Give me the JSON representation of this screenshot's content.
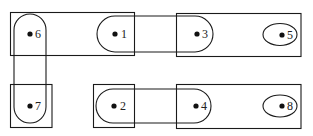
{
  "diagram": {
    "type": "hypergraph",
    "background": "#ffffff",
    "stroke_color": "#1a1a1a",
    "vertices": [
      {
        "id": "1",
        "label": "1",
        "x": 115,
        "y": 34
      },
      {
        "id": "2",
        "label": "2",
        "x": 113,
        "y": 106
      },
      {
        "id": "3",
        "label": "3",
        "x": 196,
        "y": 34
      },
      {
        "id": "4",
        "label": "4",
        "x": 195,
        "y": 106
      },
      {
        "id": "5",
        "label": "5",
        "x": 282,
        "y": 34
      },
      {
        "id": "6",
        "label": "6",
        "x": 30,
        "y": 34
      },
      {
        "id": "7",
        "label": "7",
        "x": 30,
        "y": 106
      },
      {
        "id": "8",
        "label": "8",
        "x": 282,
        "y": 106
      }
    ],
    "hyperedges": [
      {
        "name": "rect-top-left",
        "shape": "rectangle",
        "members": [
          "6",
          "1"
        ]
      },
      {
        "name": "rect-top-right",
        "shape": "rectangle",
        "members": [
          "3",
          "5"
        ]
      },
      {
        "name": "rect-bottom-7",
        "shape": "rectangle",
        "members": [
          "7"
        ]
      },
      {
        "name": "rect-bottom-2",
        "shape": "rectangle",
        "members": [
          "2"
        ]
      },
      {
        "name": "rect-bottom-right",
        "shape": "rectangle",
        "members": [
          "4",
          "8"
        ]
      },
      {
        "name": "stadium-6-7",
        "shape": "rounded",
        "members": [
          "6",
          "7"
        ]
      },
      {
        "name": "stadium-1-3",
        "shape": "rounded",
        "members": [
          "1",
          "3"
        ]
      },
      {
        "name": "stadium-2-4",
        "shape": "rounded",
        "members": [
          "2",
          "4"
        ]
      },
      {
        "name": "ellipse-5",
        "shape": "ellipse",
        "members": [
          "5"
        ]
      },
      {
        "name": "ellipse-8",
        "shape": "ellipse",
        "members": [
          "8"
        ]
      }
    ]
  }
}
